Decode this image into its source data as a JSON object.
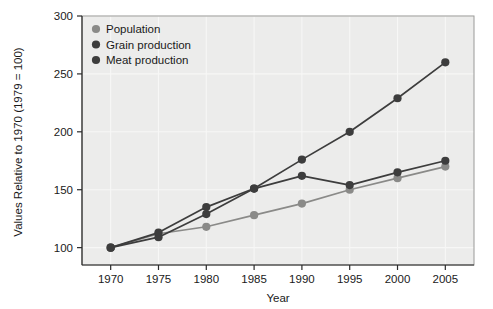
{
  "chart_data": {
    "type": "line",
    "title": "",
    "xlabel": "Year",
    "ylabel": "Values Relative to 1970 (1979 = 100)",
    "x": [
      1970,
      1975,
      1980,
      1985,
      1990,
      1995,
      2000,
      2005
    ],
    "xtick_labels": [
      "1970",
      "1975",
      "1980",
      "1985",
      "1990",
      "1995",
      "2000",
      "2005"
    ],
    "ytick_labels": [
      "100",
      "150",
      "200",
      "250",
      "300"
    ],
    "yticks": [
      100,
      150,
      200,
      250,
      300
    ],
    "xlim": [
      1967,
      2008
    ],
    "ylim": [
      85,
      300
    ],
    "grid": true,
    "legend_position": "top-left",
    "series": [
      {
        "name": "Population",
        "color": "#8a8a88",
        "values": [
          100,
          112,
          118,
          128,
          138,
          150,
          160,
          170
        ]
      },
      {
        "name": "Grain production",
        "color": "#3d3d3d",
        "values": [
          100,
          109,
          129,
          151,
          162,
          154,
          165,
          175
        ]
      },
      {
        "name": "Meat production",
        "color": "#3d3d3d",
        "values": [
          100,
          113,
          135,
          151,
          176,
          200,
          229,
          260
        ]
      }
    ]
  },
  "legend": {
    "items": [
      {
        "label": "Population",
        "marker_color": "#8a8a88"
      },
      {
        "label": "Grain production",
        "marker_color": "#3d3d3d"
      },
      {
        "label": "Meat production",
        "marker_color": "#3d3d3d"
      }
    ]
  }
}
